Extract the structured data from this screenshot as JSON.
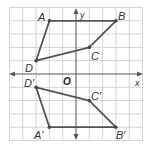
{
  "diagram": {
    "type": "coordinate-plane-reflection",
    "grid": {
      "x_min": -5,
      "x_max": 5,
      "y_min": -5,
      "y_max": 5,
      "line_color": "#c8c8c8",
      "axis_color": "#555555"
    },
    "axes": {
      "x_label": "x",
      "y_label": "y",
      "origin_label": "O"
    },
    "figures": [
      {
        "name": "ABCD",
        "color": "#555555",
        "vertices": [
          {
            "label": "A",
            "x": -2,
            "y": 4
          },
          {
            "label": "B",
            "x": 3,
            "y": 4
          },
          {
            "label": "C",
            "x": 1,
            "y": 2
          },
          {
            "label": "D",
            "x": -3,
            "y": 1
          }
        ]
      },
      {
        "name": "A'B'C'D'",
        "color": "#555555",
        "vertices": [
          {
            "label": "A'",
            "x": -2,
            "y": -4
          },
          {
            "label": "B'",
            "x": 3,
            "y": -4
          },
          {
            "label": "C'",
            "x": 1,
            "y": -2
          },
          {
            "label": "D'",
            "x": -3,
            "y": -1
          }
        ]
      }
    ],
    "labels": {
      "A": "A",
      "B": "B",
      "C": "C",
      "D": "D",
      "A_prime": "A′",
      "B_prime": "B′",
      "C_prime": "C′",
      "D_prime": "D′",
      "x": "x",
      "y": "y",
      "O": "O"
    }
  }
}
